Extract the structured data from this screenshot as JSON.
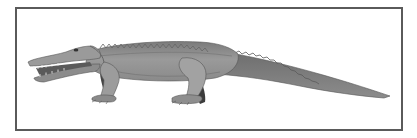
{
  "figure": {
    "alt": "Side-view grayscale illustration of a long-snouted, crocodile-like reptile with open jaws, walking on four legs, with a long tapering tail, inside a rectangular frame",
    "colors": {
      "frame": "#5a5a5a",
      "body_light": "#a8a8a8",
      "body_mid": "#8c8c8c",
      "body_dark": "#5e5e5e",
      "shadow": "#3a3a3a",
      "background": "#ffffff"
    }
  }
}
